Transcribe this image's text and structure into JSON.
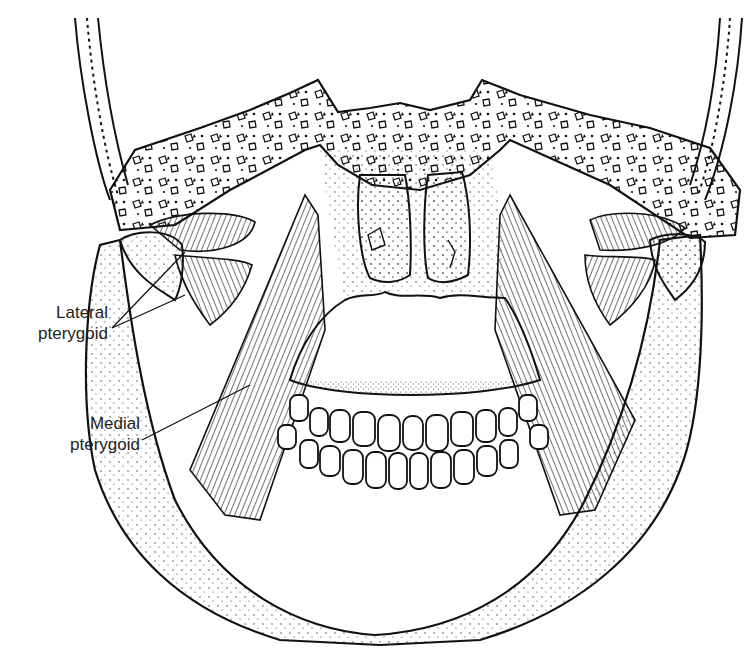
{
  "figure": {
    "labels": [
      {
        "id": "lateral",
        "line1": "Lateral",
        "line2": "pterygoid"
      },
      {
        "id": "medial",
        "line1": "Medial",
        "line2": "pterygoid"
      }
    ]
  },
  "colors": {
    "ink": "#1a1a1a",
    "paper": "#ffffff",
    "text": "#222222"
  }
}
